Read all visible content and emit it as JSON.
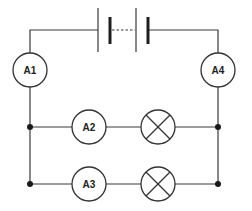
{
  "diagram": {
    "type": "circuit",
    "colors": {
      "line": "#3a3a3a",
      "background": "#ffffff"
    },
    "battery": {
      "cells": 2,
      "icon": "battery-icon"
    },
    "ammeters": [
      {
        "id": "A1",
        "label": "A1",
        "position": "left-series"
      },
      {
        "id": "A4",
        "label": "A4",
        "position": "right-series"
      },
      {
        "id": "A2",
        "label": "A2",
        "position": "branch-1"
      },
      {
        "id": "A3",
        "label": "A3",
        "position": "branch-2"
      }
    ],
    "lamps": [
      {
        "id": "L1",
        "branch": "branch-1",
        "icon": "lamp-icon"
      },
      {
        "id": "L2",
        "branch": "branch-2",
        "icon": "lamp-icon"
      }
    ],
    "junctions": 4
  }
}
